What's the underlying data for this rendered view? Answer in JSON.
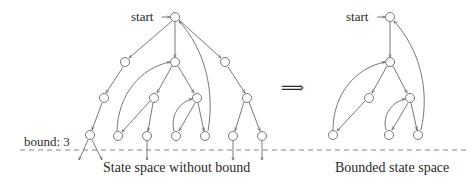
{
  "labels": {
    "start_left": "start",
    "start_right": "start",
    "bound": "bound: 3",
    "caption_left": "State space without bound",
    "caption_right": "Bounded state space",
    "implies": "⟹"
  },
  "colors": {
    "stroke": "#555555",
    "text": "#2a2a2a",
    "dash": "#666666"
  },
  "left_graph": {
    "nodes": [
      {
        "id": "s",
        "x": 175,
        "y": 17
      },
      {
        "id": "a",
        "x": 125,
        "y": 62
      },
      {
        "id": "b",
        "x": 175,
        "y": 62
      },
      {
        "id": "c",
        "x": 225,
        "y": 62
      },
      {
        "id": "d",
        "x": 104,
        "y": 98
      },
      {
        "id": "e",
        "x": 154,
        "y": 98
      },
      {
        "id": "f",
        "x": 197,
        "y": 98
      },
      {
        "id": "g",
        "x": 247,
        "y": 98
      },
      {
        "id": "h",
        "x": 90,
        "y": 135
      },
      {
        "id": "i",
        "x": 118,
        "y": 136
      },
      {
        "id": "j",
        "x": 147,
        "y": 136
      },
      {
        "id": "k",
        "x": 176,
        "y": 136
      },
      {
        "id": "l",
        "x": 205,
        "y": 136
      },
      {
        "id": "m",
        "x": 233,
        "y": 136
      },
      {
        "id": "n",
        "x": 262,
        "y": 136
      }
    ]
  },
  "right_graph": {
    "nodes": [
      {
        "id": "s",
        "x": 390,
        "y": 17
      },
      {
        "id": "b",
        "x": 390,
        "y": 62
      },
      {
        "id": "e",
        "x": 369,
        "y": 98
      },
      {
        "id": "f",
        "x": 410,
        "y": 98
      },
      {
        "id": "i",
        "x": 333,
        "y": 135
      },
      {
        "id": "k",
        "x": 389,
        "y": 135
      },
      {
        "id": "l",
        "x": 418,
        "y": 135
      }
    ]
  },
  "bound_line_y": 150
}
